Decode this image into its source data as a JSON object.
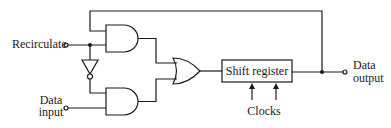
{
  "diagram": {
    "type": "logic-circuit",
    "colors": {
      "line": "#1a1a1a",
      "background": "#ffffff"
    },
    "inputs": {
      "recirculate": {
        "label": "Recirculate"
      },
      "data_input": {
        "label_line1": "Data",
        "label_line2": "input"
      }
    },
    "outputs": {
      "data_output": {
        "label_line1": "Data",
        "label_line2": "output"
      }
    },
    "components": {
      "and_gate_upper": {
        "kind": "AND"
      },
      "and_gate_lower": {
        "kind": "AND"
      },
      "inverter": {
        "kind": "NOT"
      },
      "or_gate": {
        "kind": "OR"
      },
      "shift_register": {
        "label": "Shift register"
      }
    },
    "clocks": {
      "label": "Clocks",
      "arrow_count": 2
    }
  }
}
